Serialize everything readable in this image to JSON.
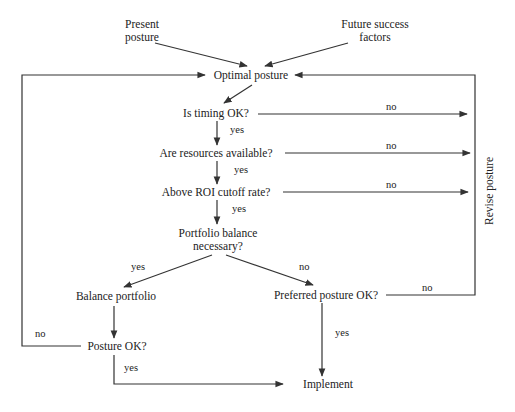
{
  "diagram": {
    "type": "flowchart",
    "title": "",
    "inputs": {
      "present_posture_l1": "Present",
      "present_posture_l2": "posture",
      "future_success_l1": "Future success",
      "future_success_l2": "factors"
    },
    "nodes": {
      "optimal_posture": "Optimal posture",
      "timing": "Is timing OK?",
      "resources": "Are resources available?",
      "roi": "Above ROI cutoff rate?",
      "balance_question_l1": "Portfolio balance",
      "balance_question_l2": "necessary?",
      "balance_portfolio": "Balance portfolio",
      "preferred_posture": "Preferred posture OK?",
      "posture_ok": "Posture OK?",
      "implement": "Implement",
      "revise_posture": "Revise posture"
    },
    "edge_labels": {
      "timing_yes": "yes",
      "timing_no": "no",
      "resources_yes": "yes",
      "resources_no": "no",
      "roi_yes": "yes",
      "roi_no": "no",
      "balance_yes": "yes",
      "balance_no": "no",
      "preferred_yes": "yes",
      "preferred_no": "no",
      "posture_yes": "yes",
      "posture_no": "no"
    },
    "colors": {
      "line": "#333333",
      "text": "#222222",
      "background": "#ffffff"
    }
  }
}
